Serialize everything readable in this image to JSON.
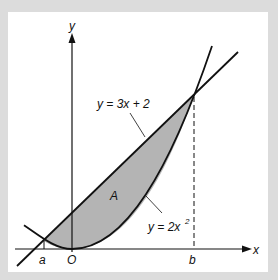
{
  "figure": {
    "labels": {
      "y_axis": "y",
      "x_axis": "x",
      "origin": "O",
      "point_a": "a",
      "point_b": "b",
      "region": "A",
      "line_eq_prefix": "y = 3x + 2",
      "parabola_eq_prefix": "y = 2x",
      "parabola_exponent": "2"
    },
    "colors": {
      "background": "#dcdcdc",
      "panel": "#ffffff",
      "shade": "#b4b4b4",
      "ink": "#111111"
    },
    "curves": [
      {
        "name": "line",
        "equation": "y = 3x + 2"
      },
      {
        "name": "parabola",
        "equation": "y = 2x^2"
      }
    ],
    "intersections": [
      "a",
      "b"
    ]
  }
}
